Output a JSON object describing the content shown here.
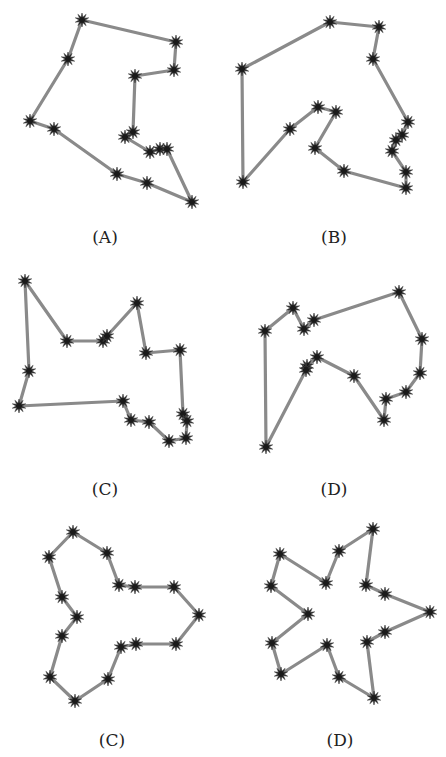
{
  "figure": {
    "width": 446,
    "height": 757,
    "edge_color": "#8a8a8a",
    "vertex_color": "#1a1a1a",
    "panels": [
      {
        "id": "A",
        "label": "(A)",
        "label_pos": [
          105,
          245
        ],
        "points": [
          [
            82,
            20
          ],
          [
            176,
            42
          ],
          [
            174,
            70
          ],
          [
            135,
            76
          ],
          [
            133,
            132
          ],
          [
            125,
            137
          ],
          [
            150,
            152
          ],
          [
            160,
            149
          ],
          [
            167,
            149
          ],
          [
            192,
            202
          ],
          [
            147,
            183
          ],
          [
            117,
            174
          ],
          [
            54,
            129
          ],
          [
            30,
            121
          ],
          [
            68,
            59
          ]
        ]
      },
      {
        "id": "B",
        "label": "(B)",
        "label_pos": [
          334,
          245
        ],
        "points": [
          [
            330,
            22
          ],
          [
            379,
            27
          ],
          [
            373,
            59
          ],
          [
            408,
            122
          ],
          [
            402,
            135
          ],
          [
            396,
            140
          ],
          [
            392,
            151
          ],
          [
            406,
            172
          ],
          [
            406,
            188
          ],
          [
            344,
            171
          ],
          [
            315,
            148
          ],
          [
            336,
            112
          ],
          [
            318,
            107
          ],
          [
            290,
            129
          ],
          [
            243,
            182
          ],
          [
            242,
            69
          ]
        ]
      },
      {
        "id": "C",
        "label": "(C)",
        "label_pos": [
          105,
          497
        ],
        "points": [
          [
            25,
            281
          ],
          [
            67,
            341
          ],
          [
            103,
            341
          ],
          [
            107,
            336
          ],
          [
            137,
            303
          ],
          [
            146,
            353
          ],
          [
            180,
            350
          ],
          [
            183,
            414
          ],
          [
            187,
            421
          ],
          [
            186,
            438
          ],
          [
            169,
            441
          ],
          [
            149,
            422
          ],
          [
            131,
            420
          ],
          [
            123,
            401
          ],
          [
            19,
            406
          ],
          [
            29,
            371
          ]
        ]
      },
      {
        "id": "D",
        "label": "(D)",
        "label_pos": [
          334,
          497
        ],
        "points": [
          [
            399,
            292
          ],
          [
            422,
            339
          ],
          [
            420,
            373
          ],
          [
            406,
            392
          ],
          [
            386,
            399
          ],
          [
            384,
            420
          ],
          [
            354,
            376
          ],
          [
            317,
            357
          ],
          [
            307,
            366
          ],
          [
            306,
            370
          ],
          [
            266,
            447
          ],
          [
            265,
            331
          ],
          [
            293,
            308
          ],
          [
            304,
            329
          ],
          [
            314,
            320
          ]
        ]
      },
      {
        "id": "C2",
        "label": "(C)",
        "label_pos": [
          112,
          748
        ],
        "points": [
          [
            73,
            532
          ],
          [
            107,
            553
          ],
          [
            119,
            585
          ],
          [
            135,
            587
          ],
          [
            174,
            587
          ],
          [
            199,
            615
          ],
          [
            176,
            644
          ],
          [
            136,
            644
          ],
          [
            121,
            647
          ],
          [
            108,
            679
          ],
          [
            75,
            701
          ],
          [
            50,
            677
          ],
          [
            62,
            636
          ],
          [
            77,
            617
          ],
          [
            62,
            597
          ],
          [
            49,
            557
          ]
        ]
      },
      {
        "id": "D2",
        "label": "(D)",
        "label_pos": [
          340,
          748
        ],
        "points": [
          [
            373,
            529
          ],
          [
            366,
            585
          ],
          [
            385,
            594
          ],
          [
            430,
            612
          ],
          [
            385,
            632
          ],
          [
            367,
            642
          ],
          [
            374,
            698
          ],
          [
            339,
            677
          ],
          [
            327,
            645
          ],
          [
            281,
            674
          ],
          [
            272,
            643
          ],
          [
            308,
            614
          ],
          [
            271,
            586
          ],
          [
            280,
            554
          ],
          [
            326,
            583
          ],
          [
            339,
            551
          ]
        ]
      }
    ]
  }
}
